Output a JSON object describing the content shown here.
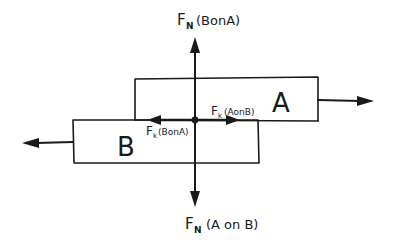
{
  "diagram": {
    "type": "free-body-diagram",
    "ink_color": "#1a1a1a",
    "background": "#ffffff",
    "blocks": [
      {
        "id": "A",
        "label": "A"
      },
      {
        "id": "B",
        "label": "B"
      }
    ],
    "forces": {
      "normal_top": {
        "symbol": "F",
        "subscript": "N",
        "qualifier": "(BonA)"
      },
      "normal_bottom": {
        "symbol": "F",
        "subscript": "N",
        "qualifier": "(A on B)"
      },
      "kinetic_right": {
        "symbol": "F",
        "subscript": "k",
        "qualifier": "(AonB)"
      },
      "kinetic_left": {
        "symbol": "F",
        "subscript": "k",
        "qualifier": "(BonA)"
      }
    }
  }
}
